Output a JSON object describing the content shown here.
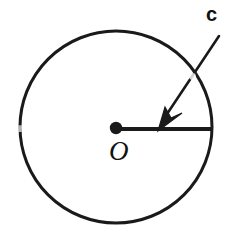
{
  "figure": {
    "background_color": "#ffffff",
    "stroke_color": "#1a1a1a",
    "labels": {
      "center_point": "O",
      "radius_annotation": "c"
    },
    "icons": {
      "center_dot": "filled-dot-icon",
      "arrow": "arrow-pointer-icon"
    },
    "geometry": {
      "circle_center_x": 116,
      "circle_center_y": 127,
      "circle_radius": 96,
      "circle_stroke_width": 3,
      "radius_line_start_x": 116,
      "radius_line_start_y": 129,
      "radius_line_end_x": 212,
      "radius_line_end_y": 129,
      "radius_line_stroke_width": 4,
      "center_dot_radius": 6,
      "arrow_tail_x": 219,
      "arrow_tail_y": 36,
      "arrow_tip_x": 158,
      "arrow_tip_y": 128,
      "arrow_stroke_width": 3
    }
  }
}
